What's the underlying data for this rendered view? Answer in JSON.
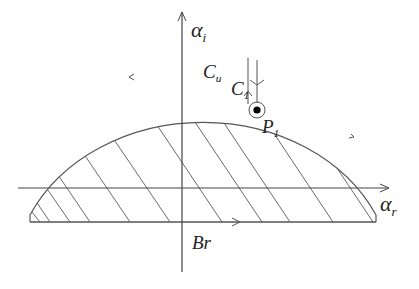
{
  "diagram": {
    "type": "contour-region",
    "axes": {
      "horizontal": {
        "symbol": "α",
        "subscript": "r"
      },
      "vertical": {
        "symbol": "α",
        "subscript": "i"
      }
    },
    "labels": {
      "contour_outer": {
        "symbol": "C",
        "subscript": "u"
      },
      "contour_inner": {
        "symbol": "C",
        "subscript": "1"
      },
      "pole": {
        "symbol": "P",
        "subscript": "1"
      },
      "base": "Br"
    },
    "colors": {
      "stroke": "#555555",
      "hatch": "#666666",
      "text": "#222222",
      "pole_fill": "#000000"
    }
  }
}
